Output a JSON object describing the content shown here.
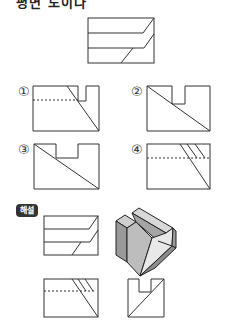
{
  "question": {
    "title_cut": "평면 도이다"
  },
  "choices": [
    {
      "label": "①"
    },
    {
      "label": "②"
    },
    {
      "label": "③"
    },
    {
      "label": "④"
    }
  ],
  "explanation": {
    "badge": "해설"
  },
  "colors": {
    "line": "#333333",
    "dash": "#555555",
    "face_light": "#e4e4e4",
    "face_mid": "#bdbdbd",
    "face_dark": "#8f8f8f",
    "badge_bg": "#333333"
  }
}
